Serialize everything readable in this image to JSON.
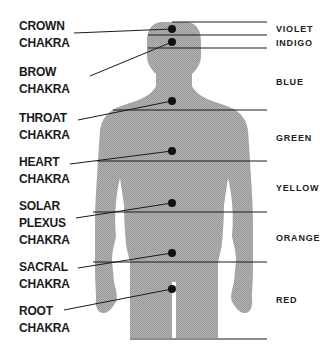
{
  "diagram": {
    "type": "chakra-body-map",
    "chakras": [
      {
        "lines": [
          "CROWN",
          "CHAKRA"
        ],
        "dot": [
          172,
          29
        ],
        "label_top": 19
      },
      {
        "lines": [
          "BROW",
          "CHAKRA"
        ],
        "dot": [
          172,
          42
        ],
        "label_top": 65
      },
      {
        "lines": [
          "THROAT",
          "CHAKRA"
        ],
        "dot": [
          172,
          101
        ],
        "label_top": 111
      },
      {
        "lines": [
          "HEART",
          "CHAKRA"
        ],
        "dot": [
          172,
          151
        ],
        "label_top": 155
      },
      {
        "lines": [
          "SOLAR",
          "PLEXUS",
          "CHAKRA"
        ],
        "dot": [
          172,
          203
        ],
        "label_top": 199
      },
      {
        "lines": [
          "SACRAL",
          "CHAKRA"
        ],
        "dot": [
          172,
          253
        ],
        "label_top": 260
      },
      {
        "lines": [
          "ROOT",
          "CHAKRA"
        ],
        "dot": [
          172,
          289
        ],
        "label_top": 304
      }
    ],
    "colors": [
      {
        "name": "VIOLET",
        "top": 25
      },
      {
        "name": "INDIGO",
        "top": 39
      },
      {
        "name": "BLUE",
        "top": 77
      },
      {
        "name": "GREEN",
        "top": 133
      },
      {
        "name": "YELLOW",
        "top": 183
      },
      {
        "name": "ORANGE",
        "top": 233
      },
      {
        "name": "RED",
        "top": 295
      }
    ],
    "palette": {
      "silhouette": "#a8a8a8",
      "lines": "#1a1a1a",
      "dots": "#111111",
      "text": "#1a1a1a"
    }
  }
}
